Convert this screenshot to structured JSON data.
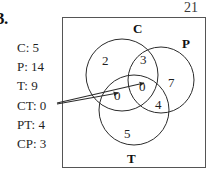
{
  "problem": {
    "number": "3.",
    "page_number": "21"
  },
  "givens": {
    "rows": [
      {
        "label": "C: 5"
      },
      {
        "label": "P: 14"
      },
      {
        "label": "T: 9"
      },
      {
        "label": "CT: 0"
      },
      {
        "label": "PT: 4"
      },
      {
        "label": "CP: 3"
      }
    ]
  },
  "venn": {
    "set_labels": {
      "c": "C",
      "p": "P",
      "t": "T"
    },
    "region_counts": {
      "c_only": "2",
      "c_and_p": "3",
      "p_only": "7",
      "c_and_t": "0",
      "c_and_p_and_t": "0",
      "p_and_t": "4",
      "t_only": "5"
    }
  },
  "colors": {
    "stroke": "#2b2b2b",
    "box_border": "#555555",
    "text": "#1f1f1f"
  }
}
